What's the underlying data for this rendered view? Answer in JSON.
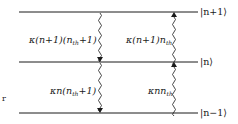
{
  "diagram": {
    "levels": [
      {
        "id": "upper",
        "label": "|n+1⟩",
        "y": 12
      },
      {
        "id": "middle",
        "label": "|n⟩",
        "y": 62
      },
      {
        "id": "lower",
        "label": "|n−1⟩",
        "y": 113
      }
    ],
    "transitions": [
      {
        "id": "emission-upper",
        "from": "|n+1⟩",
        "to": "|n⟩",
        "direction": "down",
        "rate_main": "κ(n+1)(n",
        "rate_sub": "th",
        "rate_tail": "+1)"
      },
      {
        "id": "absorption-upper",
        "from": "|n⟩",
        "to": "|n+1⟩",
        "direction": "up",
        "rate_main": "κ(n+1)n",
        "rate_sub": "th",
        "rate_tail": ""
      },
      {
        "id": "emission-lower",
        "from": "|n⟩",
        "to": "|n−1⟩",
        "direction": "down",
        "rate_main": "κn(n",
        "rate_sub": "th",
        "rate_tail": "+1)"
      },
      {
        "id": "absorption-lower",
        "from": "|n−1⟩",
        "to": "|n⟩",
        "direction": "up",
        "rate_main": "κnn",
        "rate_sub": "th",
        "rate_tail": ""
      }
    ],
    "stray_text": "r",
    "colors": {
      "line": "#1a1a1a",
      "background": "#ffffff"
    }
  }
}
